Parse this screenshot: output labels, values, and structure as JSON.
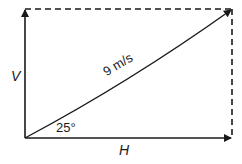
{
  "diagram": {
    "type": "vector-resolution",
    "labels": {
      "vertical_component": "V",
      "horizontal_component": "H",
      "resultant": "9 m/s",
      "angle": "25°"
    },
    "colors": {
      "line": "#1a1a1a",
      "background": "#ffffff"
    }
  }
}
